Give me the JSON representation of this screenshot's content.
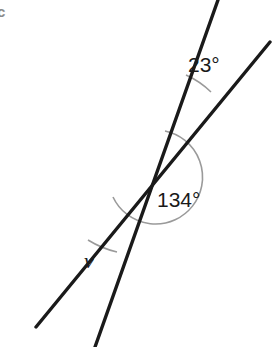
{
  "figure": {
    "part_label": "c",
    "background_color": "#ffffff",
    "line_color": "#1a1a1a",
    "arc_color": "#9a9a9a",
    "label_color": "#1a1a1a",
    "part_label_color": "#8a8a8a",
    "width": 272,
    "height": 347
  },
  "diagram": {
    "type": "intersecting-lines-angles",
    "vertex": {
      "x": 126,
      "y": 158
    },
    "lines": [
      {
        "name": "steep-line",
        "from": {
          "x": 218,
          "y": 0
        },
        "to": {
          "x": 95,
          "y": 347
        },
        "stroke_width": 3.4
      },
      {
        "name": "shallow-line",
        "from": {
          "x": 270,
          "y": 42
        },
        "to": {
          "x": 36,
          "y": 327
        },
        "stroke_width": 3.4
      }
    ],
    "angles": [
      {
        "name": "angle-23",
        "label": "23°",
        "value": 23,
        "unit": "degrees",
        "label_x": 188,
        "label_y": 54,
        "arc_radius": 86,
        "arc_start": {
          "x": 186,
          "y": 75
        },
        "arc_end": {
          "x": 211,
          "y": 92
        }
      },
      {
        "name": "angle-134",
        "label": "134°",
        "value": 134,
        "unit": "degrees",
        "label_x": 157,
        "label_y": 189,
        "arc_radius": 47,
        "arc_start": {
          "x": 165,
          "y": 131
        },
        "arc_end": {
          "x": 113,
          "y": 197
        }
      },
      {
        "name": "angle-v",
        "label": "v",
        "value": null,
        "unit": "variable",
        "label_x": 84,
        "label_y": 250,
        "arc_radius": 96,
        "arc_start": {
          "x": 88,
          "y": 240
        },
        "arc_end": {
          "x": 117,
          "y": 252
        }
      }
    ]
  }
}
